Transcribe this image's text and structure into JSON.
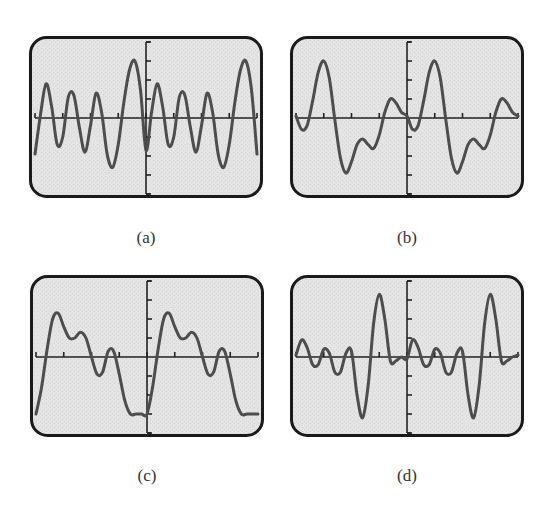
{
  "figure": {
    "colors": {
      "background": "#ffffff",
      "screen_fill": "#e4e4e4",
      "screen_border": "#1a1a1a",
      "axis": "#222222",
      "curve": "#4d4d4d"
    }
  },
  "panels": [
    {
      "id": "a",
      "label": "(a)"
    },
    {
      "id": "b",
      "label": "(b)"
    },
    {
      "id": "c",
      "label": "(c)"
    },
    {
      "id": "d",
      "label": "(d)"
    }
  ],
  "chart_data": [
    {
      "type": "line",
      "title": "(a)",
      "xlabel": "",
      "ylabel": "",
      "grid": false,
      "x_ticks_per_side": 4,
      "y_ticks_per_side": 4,
      "xlim": [
        -4,
        4
      ],
      "ylim": [
        -4,
        4
      ],
      "x": [
        -4,
        -3.8,
        -3.6,
        -3.4,
        -3.2,
        -3,
        -2.8,
        -2.6,
        -2.4,
        -2.2,
        -2,
        -1.8,
        -1.6,
        -1.4,
        -1.2,
        -1,
        -0.8,
        -0.6,
        -0.4,
        -0.2,
        0,
        0.2,
        0.4,
        0.6,
        0.8,
        1,
        1.2,
        1.4,
        1.6,
        1.8,
        2,
        2.2,
        2.4,
        2.6,
        2.8,
        3,
        3.2,
        3.4,
        3.6,
        3.8,
        4
      ],
      "y": [
        -1.9,
        0.2,
        1.8,
        0.6,
        -1.4,
        -1.0,
        1.1,
        1.2,
        -0.5,
        -1.8,
        -0.4,
        1.3,
        0.3,
        -1.9,
        -2.6,
        -1.4,
        0.8,
        2.5,
        3.0,
        1.5,
        -1.7,
        0.3,
        1.8,
        0.6,
        -1.4,
        -1.0,
        1.1,
        1.2,
        -0.5,
        -1.8,
        -0.4,
        1.3,
        0.3,
        -1.9,
        -2.6,
        -1.4,
        0.8,
        2.5,
        3.0,
        1.5,
        -1.9
      ]
    },
    {
      "type": "line",
      "title": "(b)",
      "xlabel": "",
      "ylabel": "",
      "grid": false,
      "x_ticks_per_side": 4,
      "y_ticks_per_side": 4,
      "xlim": [
        -4,
        4
      ],
      "ylim": [
        -4,
        4
      ],
      "x": [
        -4,
        -3.8,
        -3.6,
        -3.4,
        -3.2,
        -3,
        -2.8,
        -2.6,
        -2.4,
        -2.2,
        -2,
        -1.8,
        -1.6,
        -1.4,
        -1.2,
        -1,
        -0.8,
        -0.6,
        -0.4,
        -0.2,
        0,
        0.2,
        0.4,
        0.6,
        0.8,
        1,
        1.2,
        1.4,
        1.6,
        1.8,
        2,
        2.2,
        2.4,
        2.6,
        2.8,
        3,
        3.2,
        3.4,
        3.6,
        3.8,
        4
      ],
      "y": [
        0.1,
        -0.6,
        -0.4,
        0.9,
        2.4,
        3.0,
        2.1,
        -0.1,
        -2.1,
        -2.9,
        -2.3,
        -1.4,
        -1.1,
        -1.4,
        -1.6,
        -0.9,
        0.3,
        1.0,
        0.8,
        0.3,
        0.1,
        -0.6,
        -0.4,
        0.9,
        2.4,
        3.0,
        2.1,
        -0.1,
        -2.1,
        -2.9,
        -2.3,
        -1.4,
        -1.1,
        -1.4,
        -1.6,
        -0.9,
        0.3,
        1.0,
        0.8,
        0.3,
        0.1
      ]
    },
    {
      "type": "line",
      "title": "(c)",
      "xlabel": "",
      "ylabel": "",
      "grid": false,
      "x_ticks_per_side": 4,
      "y_ticks_per_side": 4,
      "xlim": [
        -4,
        4
      ],
      "ylim": [
        -4,
        4
      ],
      "x": [
        -4,
        -3.8,
        -3.6,
        -3.4,
        -3.2,
        -3,
        -2.8,
        -2.6,
        -2.4,
        -2.2,
        -2,
        -1.8,
        -1.6,
        -1.4,
        -1.2,
        -1,
        -0.8,
        -0.6,
        -0.4,
        -0.2,
        0,
        0.2,
        0.4,
        0.6,
        0.8,
        1,
        1.2,
        1.4,
        1.6,
        1.8,
        2,
        2.2,
        2.4,
        2.6,
        2.8,
        3,
        3.2,
        3.4,
        3.6,
        3.8,
        4
      ],
      "y": [
        -3.0,
        -1.6,
        0.4,
        2.0,
        2.3,
        1.6,
        1.0,
        1.0,
        1.3,
        1.0,
        0.0,
        -0.9,
        -0.8,
        0.3,
        0.3,
        -0.9,
        -2.3,
        -3.0,
        -3.0,
        -3.0,
        -3.0,
        -1.6,
        0.4,
        2.0,
        2.3,
        1.6,
        1.0,
        1.0,
        1.3,
        1.0,
        0.0,
        -0.9,
        -0.8,
        0.3,
        0.3,
        -0.9,
        -2.3,
        -3.0,
        -3.0,
        -3.0,
        -3.0
      ]
    },
    {
      "type": "line",
      "title": "(d)",
      "xlabel": "",
      "ylabel": "",
      "grid": false,
      "x_ticks_per_side": 4,
      "y_ticks_per_side": 4,
      "xlim": [
        -4,
        4
      ],
      "ylim": [
        -4,
        4
      ],
      "x": [
        -4,
        -3.8,
        -3.6,
        -3.4,
        -3.2,
        -3,
        -2.8,
        -2.6,
        -2.4,
        -2.2,
        -2,
        -1.8,
        -1.6,
        -1.4,
        -1.2,
        -1,
        -0.8,
        -0.6,
        -0.4,
        -0.2,
        0,
        0.2,
        0.4,
        0.6,
        0.8,
        1,
        1.2,
        1.4,
        1.6,
        1.8,
        2,
        2.2,
        2.4,
        2.6,
        2.8,
        3,
        3.2,
        3.4,
        3.6,
        3.8,
        4
      ],
      "y": [
        0.1,
        0.9,
        0.5,
        -0.4,
        -0.4,
        0.4,
        0.2,
        -0.8,
        -0.8,
        0.2,
        0.3,
        -2.0,
        -3.2,
        -1.5,
        1.8,
        3.3,
        2.0,
        -0.2,
        -0.2,
        0.0,
        -0.1,
        0.9,
        0.5,
        -0.4,
        -0.4,
        0.4,
        0.2,
        -0.8,
        -0.8,
        0.2,
        0.3,
        -2.0,
        -3.2,
        -1.5,
        1.8,
        3.3,
        2.0,
        -0.2,
        -0.2,
        0.0,
        0.1
      ]
    }
  ]
}
